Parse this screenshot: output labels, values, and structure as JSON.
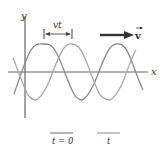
{
  "diagram": {
    "axes": {
      "x_label": "x",
      "y_label": "y"
    },
    "displacement_label": "vt",
    "velocity_label": "v",
    "legend": [
      {
        "label": "t = 0",
        "color": "#8a8a8a"
      },
      {
        "label": "t",
        "color": "#a8a8a8"
      }
    ],
    "colors": {
      "axis": "#555555",
      "arrow": "#333333",
      "wave_t0": "#8a8a8a",
      "wave_t": "#a8a8a8"
    }
  }
}
